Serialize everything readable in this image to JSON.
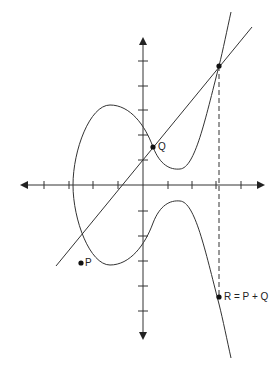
{
  "diagram": {
    "type": "elliptic-curve-addition",
    "stroke_color": "#333333",
    "points": {
      "P": {
        "label": "P"
      },
      "Q": {
        "label": "Q"
      },
      "R": {
        "label": "R = P + Q"
      }
    },
    "axes": {
      "x_ticks": 8,
      "y_ticks": 10,
      "arrows": true
    }
  }
}
